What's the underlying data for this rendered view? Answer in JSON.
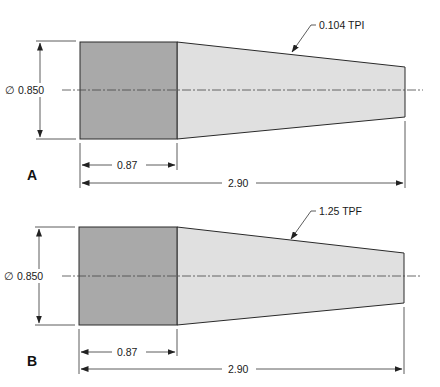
{
  "colors": {
    "cylinder_fill": "#a9a9a9",
    "taper_fill": "#e0e0e0",
    "line": "#2a2a2a",
    "background": "#ffffff"
  },
  "figures": [
    {
      "id": "A",
      "label": "A",
      "diameter_label": "∅ 0.850",
      "cylinder_length_label": "0.87",
      "overall_length_label": "2.90",
      "taper_callout": "0.104 TPI"
    },
    {
      "id": "B",
      "label": "B",
      "diameter_label": "∅ 0.850",
      "cylinder_length_label": "0.87",
      "overall_length_label": "2.90",
      "taper_callout": "1.25 TPF"
    }
  ]
}
